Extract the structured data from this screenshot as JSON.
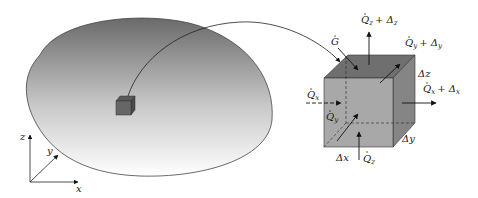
{
  "diagram": {
    "body": {
      "name": "Body",
      "gradient_top": "#6e6e6e",
      "gradient_bottom": "#ffffff",
      "outline": "#444444"
    },
    "axes": {
      "x": "x",
      "y": "y",
      "z": "z"
    },
    "element": {
      "front_color": "#a8a8a8",
      "top_color": "#6f6f6f",
      "side_color": "#858585",
      "labels": {
        "G": "G",
        "Qz_out": "Q",
        "Qz_out_sub": "z",
        "Qz_out_delta": "+ Δ",
        "Qz_out_delta_sub": "z",
        "Qy_out": "Q",
        "Qy_out_sub": "y",
        "Qy_out_delta": "+ Δ",
        "Qy_out_delta_sub": "y",
        "Qx_out": "Q",
        "Qx_out_sub": "x",
        "Qx_out_delta": "+ Δ",
        "Qx_out_delta_sub": "x",
        "Qx_in": "Q",
        "Qx_in_sub": "x",
        "Qy_in": "Q",
        "Qy_in_sub": "y",
        "Qz_in": "Q",
        "Qz_in_sub": "z",
        "dz": "Δz",
        "dx": "Δx",
        "dy": "Δy"
      }
    }
  }
}
